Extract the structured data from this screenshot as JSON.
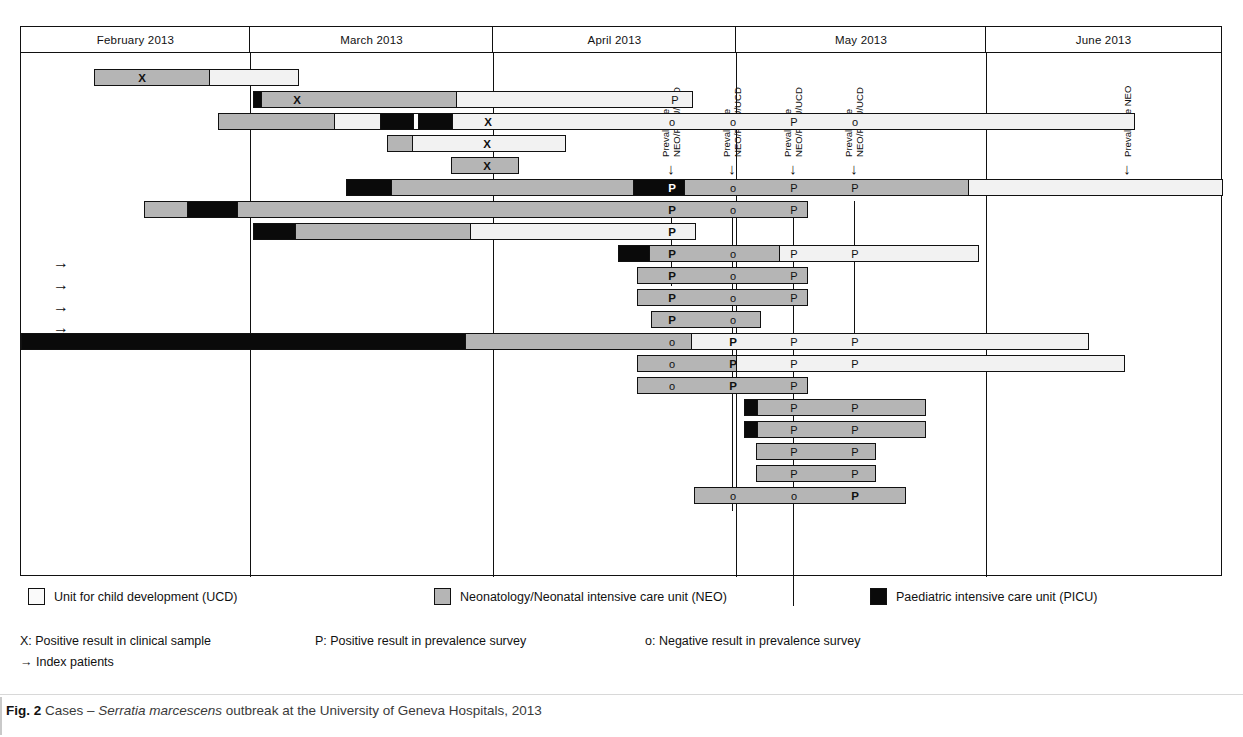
{
  "figure": {
    "label": "Fig. 2",
    "caption_pre": " Cases – ",
    "caption_italic": "Serratia marcescens",
    "caption_post": " outbreak at the University of Geneva Hospitals, 2013"
  },
  "timeline": {
    "months": [
      {
        "label": "February 2013",
        "left": 0,
        "width": 229
      },
      {
        "label": "March 2013",
        "left": 229,
        "width": 243
      },
      {
        "label": "April 2013",
        "left": 472,
        "width": 243
      },
      {
        "label": "May 2013",
        "left": 715,
        "width": 250
      },
      {
        "label": "June 2013",
        "left": 965,
        "width": 235
      }
    ],
    "gridlines": [
      229,
      472,
      715,
      965
    ]
  },
  "surveys": [
    {
      "id": "survey-1",
      "label": "Prevalence\nNEO/PICU/UCD",
      "arrow": "↓",
      "x": 650,
      "tick_top": 148,
      "tick_height": 85
    },
    {
      "id": "survey-2",
      "label": "Prevalence\nNEO/PICU/UCD",
      "arrow": "↓",
      "x": 711,
      "tick_top": 148,
      "tick_height": 310
    },
    {
      "id": "survey-3",
      "label": "Prevalence\nNEO/PICU/UCD",
      "arrow": "↓",
      "x": 772,
      "tick_top": 148,
      "tick_height": 405
    },
    {
      "id": "survey-4",
      "label": "Prevalence\nNEO/PICU/UCD",
      "arrow": "↓",
      "x": 833,
      "tick_top": 148,
      "tick_height": 135
    },
    {
      "id": "survey-5",
      "label": "Prevalence NEO",
      "arrow": "↓",
      "x": 1106,
      "tick_top": 148,
      "tick_height": 0
    }
  ],
  "index_arrows": [
    {
      "glyph": "→",
      "top": 203
    },
    {
      "glyph": "→",
      "top": 225
    },
    {
      "glyph": "→",
      "top": 247
    },
    {
      "glyph": "→",
      "top": 268
    }
  ],
  "units": {
    "ucd": {
      "key": "ucd",
      "label": "Unit for child development (UCD)",
      "color": "#f2f2f2"
    },
    "neo": {
      "key": "neo",
      "label": "Neonatology/Neonatal intensive care unit (NEO)",
      "color": "#b5b5b5"
    },
    "picu": {
      "key": "picu",
      "label": "Paediatric intensive care unit (PICU)",
      "color": "#0a0a0a"
    }
  },
  "legend_swatches": [
    {
      "key": "ucd",
      "label": "Unit for child development (UCD)",
      "left": 8
    },
    {
      "key": "neo",
      "label": "Neonatology/Neonatal intensive care unit (NEO)",
      "left": 414
    },
    {
      "key": "picu",
      "label": "Paediatric intensive care unit (PICU)",
      "left": 850
    }
  ],
  "legend_notes": [
    {
      "text": "X: Positive result in clinical sample",
      "left": 0
    },
    {
      "text": "P: Positive result in prevalence survey",
      "left": 295
    },
    {
      "text": "o: Negative result in prevalence survey",
      "left": 625
    }
  ],
  "legend_index_note": "→ Index patients",
  "marker_legend": {
    "x": "X",
    "p": "P",
    "o": "o"
  },
  "chart_data": {
    "type": "bar",
    "title": "Cases – Serratia marcescens outbreak at the University of Geneva Hospitals, 2013",
    "xlabel": "",
    "ylabel": "",
    "x_axis": "time (February 2013 – June 2013)",
    "categories": [
      "February 2013",
      "March 2013",
      "April 2013",
      "May 2013",
      "June 2013"
    ],
    "legend": [
      "Unit for child development (UCD)",
      "Neonatology/Neonatal intensive care unit (NEO)",
      "Paediatric intensive care unit (PICU)"
    ],
    "annotations": [
      "X: Positive result in clinical sample",
      "P: Positive result in prevalence survey",
      "o: Negative result in prevalence survey",
      "→ Index patients"
    ],
    "rows": [
      {
        "id": "case-1",
        "top": 16,
        "index_patient": false,
        "segments": [
          {
            "u": "neo",
            "l": 73,
            "w": 115
          },
          {
            "u": "ucd",
            "l": 188,
            "w": 90
          }
        ],
        "marks": [
          {
            "t": "X",
            "x": 120,
            "b": true
          }
        ]
      },
      {
        "id": "case-2",
        "top": 38,
        "index_patient": true,
        "segments": [
          {
            "u": "picu",
            "l": 232,
            "w": 7
          },
          {
            "u": "neo",
            "l": 239,
            "w": 196
          },
          {
            "u": "ucd",
            "l": 435,
            "w": 237
          }
        ],
        "marks": [
          {
            "t": "X",
            "x": 275,
            "b": true
          },
          {
            "t": "P",
            "x": 653,
            "b": false
          }
        ]
      },
      {
        "id": "case-3",
        "top": 60,
        "index_patient": true,
        "segments": [
          {
            "u": "neo",
            "l": 197,
            "w": 115
          },
          {
            "u": "ucd",
            "l": 312,
            "w": 46
          },
          {
            "u": "picu",
            "l": 358,
            "w": 33
          },
          {
            "u": "gap",
            "l": 391,
            "w": 5
          },
          {
            "u": "picu",
            "l": 396,
            "w": 34
          },
          {
            "u": "ucd",
            "l": 430,
            "w": 684
          }
        ],
        "marks": [
          {
            "t": "X",
            "x": 466,
            "b": true
          },
          {
            "t": "o",
            "x": 650,
            "b": false
          },
          {
            "t": "o",
            "x": 711,
            "b": false
          },
          {
            "t": "P",
            "x": 772,
            "b": false
          },
          {
            "t": "o",
            "x": 833,
            "b": false
          }
        ]
      },
      {
        "id": "case-4",
        "top": 82,
        "index_patient": true,
        "segments": [
          {
            "u": "neo",
            "l": 366,
            "w": 24
          },
          {
            "u": "ucd",
            "l": 390,
            "w": 155
          }
        ],
        "marks": [
          {
            "t": "X",
            "x": 465,
            "b": true
          }
        ]
      },
      {
        "id": "case-5",
        "top": 104,
        "index_patient": true,
        "segments": [
          {
            "u": "neo",
            "l": 430,
            "w": 68
          }
        ],
        "marks": [
          {
            "t": "X",
            "x": 465,
            "b": true
          }
        ]
      },
      {
        "id": "case-6",
        "top": 126,
        "index_patient": false,
        "segments": [
          {
            "u": "picu",
            "l": 325,
            "w": 44
          },
          {
            "u": "neo",
            "l": 369,
            "w": 243
          },
          {
            "u": "picu",
            "l": 612,
            "w": 51
          },
          {
            "u": "neo",
            "l": 663,
            "w": 284
          },
          {
            "u": "ucd",
            "l": 947,
            "w": 255
          }
        ],
        "marks": [
          {
            "t": "P",
            "x": 650,
            "b": true,
            "inv": true
          },
          {
            "t": "o",
            "x": 711,
            "b": false
          },
          {
            "t": "P",
            "x": 772,
            "b": false
          },
          {
            "t": "P",
            "x": 833,
            "b": false
          }
        ]
      },
      {
        "id": "case-7",
        "top": 148,
        "index_patient": false,
        "segments": [
          {
            "u": "neo",
            "l": 123,
            "w": 42
          },
          {
            "u": "picu",
            "l": 165,
            "w": 50
          },
          {
            "u": "neo",
            "l": 215,
            "w": 572
          }
        ],
        "marks": [
          {
            "t": "P",
            "x": 650,
            "b": true
          },
          {
            "t": "o",
            "x": 711,
            "b": false
          },
          {
            "t": "P",
            "x": 772,
            "b": false
          }
        ]
      },
      {
        "id": "case-8",
        "top": 170,
        "index_patient": false,
        "segments": [
          {
            "u": "picu",
            "l": 232,
            "w": 41
          },
          {
            "u": "neo",
            "l": 273,
            "w": 176
          },
          {
            "u": "ucd",
            "l": 449,
            "w": 226
          }
        ],
        "marks": [
          {
            "t": "P",
            "x": 650,
            "b": true
          }
        ]
      },
      {
        "id": "case-9",
        "top": 192,
        "index_patient": false,
        "segments": [
          {
            "u": "picu",
            "l": 597,
            "w": 30
          },
          {
            "u": "neo",
            "l": 627,
            "w": 131
          },
          {
            "u": "ucd",
            "l": 758,
            "w": 200
          }
        ],
        "marks": [
          {
            "t": "P",
            "x": 650,
            "b": true
          },
          {
            "t": "o",
            "x": 711,
            "b": false
          },
          {
            "t": "P",
            "x": 772,
            "b": false
          },
          {
            "t": "P",
            "x": 833,
            "b": false
          }
        ]
      },
      {
        "id": "case-10",
        "top": 214,
        "index_patient": false,
        "segments": [
          {
            "u": "neo",
            "l": 616,
            "w": 171
          }
        ],
        "marks": [
          {
            "t": "P",
            "x": 650,
            "b": true
          },
          {
            "t": "o",
            "x": 711,
            "b": false
          },
          {
            "t": "P",
            "x": 772,
            "b": false
          }
        ]
      },
      {
        "id": "case-11",
        "top": 236,
        "index_patient": false,
        "segments": [
          {
            "u": "neo",
            "l": 616,
            "w": 171
          }
        ],
        "marks": [
          {
            "t": "P",
            "x": 650,
            "b": true
          },
          {
            "t": "o",
            "x": 711,
            "b": false
          },
          {
            "t": "P",
            "x": 772,
            "b": false
          }
        ]
      },
      {
        "id": "case-12",
        "top": 258,
        "index_patient": false,
        "segments": [
          {
            "u": "neo",
            "l": 630,
            "w": 110
          }
        ],
        "marks": [
          {
            "t": "P",
            "x": 650,
            "b": true
          },
          {
            "t": "o",
            "x": 711,
            "b": false
          }
        ]
      },
      {
        "id": "case-13",
        "top": 280,
        "index_patient": false,
        "segments": [
          {
            "u": "picu",
            "l": 0,
            "w": 444
          },
          {
            "u": "neo",
            "l": 444,
            "w": 226
          },
          {
            "u": "ucd",
            "l": 670,
            "w": 398
          }
        ],
        "marks": [
          {
            "t": "o",
            "x": 650,
            "b": false
          },
          {
            "t": "P",
            "x": 711,
            "b": true
          },
          {
            "t": "P",
            "x": 772,
            "b": false
          },
          {
            "t": "P",
            "x": 833,
            "b": false
          }
        ]
      },
      {
        "id": "case-14",
        "top": 302,
        "index_patient": false,
        "segments": [
          {
            "u": "neo",
            "l": 616,
            "w": 98
          },
          {
            "u": "ucd",
            "l": 714,
            "w": 390
          }
        ],
        "marks": [
          {
            "t": "o",
            "x": 650,
            "b": false
          },
          {
            "t": "P",
            "x": 711,
            "b": true
          },
          {
            "t": "P",
            "x": 772,
            "b": false
          },
          {
            "t": "P",
            "x": 833,
            "b": false
          }
        ]
      },
      {
        "id": "case-15",
        "top": 324,
        "index_patient": false,
        "segments": [
          {
            "u": "neo",
            "l": 616,
            "w": 171
          }
        ],
        "marks": [
          {
            "t": "o",
            "x": 650,
            "b": false
          },
          {
            "t": "P",
            "x": 711,
            "b": true
          },
          {
            "t": "P",
            "x": 772,
            "b": false
          }
        ]
      },
      {
        "id": "case-16",
        "top": 346,
        "index_patient": false,
        "segments": [
          {
            "u": "picu",
            "l": 723,
            "w": 12
          },
          {
            "u": "neo",
            "l": 735,
            "w": 170
          }
        ],
        "marks": [
          {
            "t": "P",
            "x": 772,
            "b": false
          },
          {
            "t": "P",
            "x": 833,
            "b": false
          }
        ]
      },
      {
        "id": "case-17",
        "top": 368,
        "index_patient": false,
        "segments": [
          {
            "u": "picu",
            "l": 723,
            "w": 12
          },
          {
            "u": "neo",
            "l": 735,
            "w": 170
          }
        ],
        "marks": [
          {
            "t": "P",
            "x": 772,
            "b": false
          },
          {
            "t": "P",
            "x": 833,
            "b": false
          }
        ]
      },
      {
        "id": "case-18",
        "top": 390,
        "index_patient": false,
        "segments": [
          {
            "u": "neo",
            "l": 735,
            "w": 120
          }
        ],
        "marks": [
          {
            "t": "P",
            "x": 772,
            "b": false
          },
          {
            "t": "P",
            "x": 833,
            "b": false
          }
        ]
      },
      {
        "id": "case-19",
        "top": 412,
        "index_patient": false,
        "segments": [
          {
            "u": "neo",
            "l": 735,
            "w": 120
          }
        ],
        "marks": [
          {
            "t": "P",
            "x": 772,
            "b": false
          },
          {
            "t": "P",
            "x": 833,
            "b": false
          }
        ]
      },
      {
        "id": "case-20",
        "top": 434,
        "index_patient": false,
        "segments": [
          {
            "u": "neo",
            "l": 673,
            "w": 212
          }
        ],
        "marks": [
          {
            "t": "o",
            "x": 711,
            "b": false
          },
          {
            "t": "o",
            "x": 772,
            "b": false
          },
          {
            "t": "P",
            "x": 833,
            "b": true
          }
        ]
      }
    ]
  }
}
